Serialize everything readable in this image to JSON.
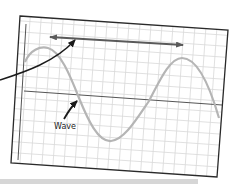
{
  "diagram": {
    "title": "",
    "labels": {
      "wave": "Wave"
    },
    "colors": {
      "frame": "#2a2a2a",
      "grid": "#d9d9d9",
      "axis": "#555555",
      "wave": "#b5b5b5",
      "arrow": "#5a5a5a",
      "pointer": "#1a1a1a",
      "bottom_bar": "#d6d6d6"
    },
    "elements": [
      {
        "id": "frame",
        "type": "rotated-rectangle",
        "desc": "grid paper frame, slightly tilted"
      },
      {
        "id": "grid",
        "type": "grid",
        "desc": "graph paper grid lines"
      },
      {
        "id": "axis",
        "type": "line",
        "desc": "horizontal center line"
      },
      {
        "id": "wave",
        "type": "sine-curve",
        "desc": "wave curve with two crests and one trough"
      },
      {
        "id": "wavelength-arrow",
        "type": "double-arrow",
        "desc": "double-headed arrow spanning crest to crest"
      },
      {
        "id": "pointer-arrow",
        "type": "curved-arrow",
        "desc": "curved arrow from left edge pointing at wavelength arrow"
      },
      {
        "id": "wave-label",
        "type": "label",
        "text": "Wave",
        "desc": "label with arrow pointing to wave curve"
      }
    ]
  }
}
